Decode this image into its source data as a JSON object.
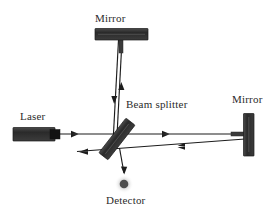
{
  "diagram": {
    "type": "optics-ray-diagram",
    "background_color": "#ffffff",
    "stroke_color": "#1c1c1c",
    "component_fill": "#333333",
    "labels": {
      "mirror_top": "Mirror",
      "mirror_right": "Mirror",
      "laser": "Laser",
      "beam_splitter": "Beam splitter",
      "detector": "Detector"
    },
    "components": [
      {
        "name": "laser-source",
        "label": "Laser",
        "shape": "rectangle",
        "x": 13,
        "y": 128,
        "width": 42,
        "height": 13,
        "fill": "#333333"
      },
      {
        "name": "laser-nozzle",
        "label": "",
        "shape": "rectangle",
        "x": 51,
        "y": 130,
        "width": 9,
        "height": 9,
        "fill": "#1c1c1c"
      },
      {
        "name": "mirror-top",
        "label": "Mirror",
        "shape": "horizontal-bar",
        "x": 95,
        "y": 29,
        "width": 53,
        "height": 11,
        "fill": "#333333"
      },
      {
        "name": "mirror-top-stem",
        "label": "",
        "shape": "vertical-stem",
        "x": 119,
        "y": 40,
        "width": 4,
        "height": 12,
        "fill": "#333333"
      },
      {
        "name": "mirror-right",
        "label": "Mirror",
        "shape": "vertical-bar",
        "x": 244,
        "y": 114,
        "width": 10,
        "height": 42,
        "fill": "#333333"
      },
      {
        "name": "mirror-right-stem",
        "label": "",
        "shape": "horizontal-stem",
        "x": 232,
        "y": 133,
        "width": 12,
        "height": 4,
        "fill": "#333333"
      },
      {
        "name": "beam-splitter",
        "label": "Beam splitter",
        "shape": "tilted-bar",
        "center_x": 117,
        "center_y": 139,
        "length": 44,
        "thickness": 11,
        "rotation_deg": -52,
        "fill": "#333333"
      },
      {
        "name": "detector",
        "label": "Detector",
        "shape": "circle-with-halo",
        "center_x": 124,
        "center_y": 184,
        "core_radius": 4.2,
        "halo_radius": 8.5,
        "core_fill": "#4a4a4a",
        "halo_fill": "#d4d4d4"
      }
    ],
    "beams": [
      {
        "name": "beam-laser-to-splitter",
        "from": [
          60,
          134
        ],
        "to": [
          170,
          134
        ],
        "arrow_at": [
          75,
          134
        ],
        "arrow_dir": "right"
      },
      {
        "name": "beam-splitter-to-mirror-right",
        "from": [
          170,
          134
        ],
        "to": [
          244,
          134
        ],
        "arrow_at": [
          165,
          134
        ],
        "arrow_dir": "right"
      },
      {
        "name": "beam-mirror-right-return",
        "from": [
          244,
          138
        ],
        "to": [
          78,
          150
        ],
        "arrow_at": [
          175,
          145
        ],
        "arrow_dir": "left"
      },
      {
        "name": "beam-return-to-exit-left",
        "from": [
          118,
          148
        ],
        "to": [
          78,
          152
        ],
        "arrow_at": [
          80,
          152
        ],
        "arrow_dir": "left"
      },
      {
        "name": "beam-splitter-to-mirror-top",
        "from": [
          116,
          143
        ],
        "to": [
          122,
          40
        ],
        "arrow_at": [
          121,
          88
        ],
        "arrow_dir": "up"
      },
      {
        "name": "beam-mirror-top-return",
        "from": [
          118,
          40
        ],
        "to": [
          112,
          155
        ],
        "arrow_at": [
          114,
          98
        ],
        "arrow_dir": "down"
      },
      {
        "name": "beam-splitter-to-detector",
        "from": [
          119,
          150
        ],
        "to": [
          124,
          174
        ],
        "arrow_at": [
          124,
          172
        ],
        "arrow_dir": "down"
      }
    ]
  }
}
